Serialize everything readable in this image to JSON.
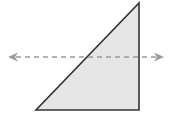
{
  "diagram": {
    "type": "geometry",
    "shapes": [
      {
        "kind": "right-triangle",
        "vertices": [
          [
            36,
            110
          ],
          [
            139,
            110
          ],
          [
            139,
            3
          ]
        ],
        "fill": "#e6e6e6",
        "stroke": "#333333"
      }
    ],
    "lines": [
      {
        "kind": "dashed-double-arrow",
        "from": [
          8,
          57
        ],
        "to": [
          164,
          57
        ],
        "stroke": "#9a9a9a",
        "arrowheads": "both"
      }
    ]
  }
}
